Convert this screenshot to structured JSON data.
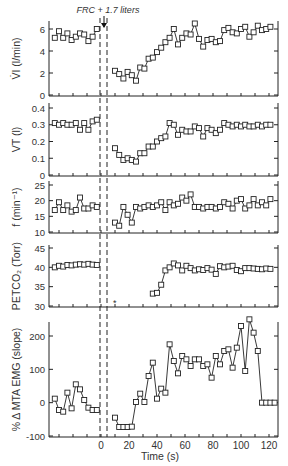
{
  "annotation": "FRC + 1.7 liters",
  "xaxis": {
    "label": "Time (s)",
    "ticks": [
      0,
      20,
      40,
      60,
      80,
      100,
      120
    ],
    "range": [
      -37,
      126
    ]
  },
  "chart_data": [
    {
      "type": "line",
      "ylabel": "V̇I (l/min)",
      "yticks": [
        0,
        2,
        4,
        6
      ],
      "ylim": [
        0,
        7
      ],
      "series": [
        {
          "name": "pre",
          "x": [
            -33,
            -30,
            -27,
            -24,
            -21,
            -18,
            -15,
            -12,
            -9,
            -6,
            -3
          ],
          "values": [
            5.2,
            5.8,
            5.2,
            5.6,
            5.0,
            5.3,
            5.6,
            5.5,
            4.9,
            5.3,
            6.0
          ]
        },
        {
          "name": "post",
          "x": [
            10,
            13,
            16,
            19,
            22,
            25,
            28,
            31,
            34,
            37,
            40,
            43,
            46,
            49,
            52,
            55,
            58,
            61,
            64,
            67,
            70,
            73,
            76,
            79,
            82,
            85,
            88,
            91,
            94,
            97,
            100,
            103,
            106,
            109,
            112,
            115,
            118,
            121
          ],
          "values": [
            2.2,
            1.9,
            1.5,
            2.1,
            1.8,
            1.3,
            2.5,
            2.4,
            3.3,
            3.4,
            3.9,
            4.3,
            4.8,
            5.2,
            6.0,
            4.6,
            5.2,
            5.6,
            5.5,
            6.5,
            5.1,
            4.4,
            5.0,
            5.1,
            4.8,
            4.9,
            5.9,
            6.1,
            5.7,
            5.6,
            6.0,
            6.2,
            5.3,
            5.7,
            6.3,
            5.9,
            6.0,
            6.2
          ]
        }
      ]
    },
    {
      "type": "line",
      "ylabel": "VT (l)",
      "yticks": [
        0,
        0.1,
        0.2,
        0.3,
        0.4
      ],
      "ylim": [
        0,
        0.4
      ],
      "series": [
        {
          "name": "pre",
          "x": [
            -33,
            -30,
            -27,
            -24,
            -21,
            -18,
            -15,
            -12,
            -9,
            -6,
            -3
          ],
          "values": [
            0.31,
            0.3,
            0.31,
            0.3,
            0.3,
            0.31,
            0.27,
            0.31,
            0.27,
            0.32,
            0.33
          ]
        },
        {
          "name": "post",
          "x": [
            10,
            13,
            16,
            19,
            22,
            25,
            28,
            31,
            34,
            37,
            40,
            43,
            46,
            49,
            52,
            55,
            58,
            61,
            64,
            67,
            70,
            73,
            76,
            79,
            82,
            85,
            88,
            91,
            94,
            97,
            100,
            103,
            106,
            109,
            112,
            115,
            118,
            121
          ],
          "values": [
            0.16,
            0.12,
            0.09,
            0.1,
            0.09,
            0.08,
            0.13,
            0.13,
            0.17,
            0.17,
            0.2,
            0.22,
            0.23,
            0.31,
            0.3,
            0.24,
            0.27,
            0.26,
            0.26,
            0.29,
            0.28,
            0.23,
            0.28,
            0.27,
            0.25,
            0.27,
            0.31,
            0.3,
            0.29,
            0.3,
            0.29,
            0.3,
            0.29,
            0.29,
            0.3,
            0.29,
            0.3,
            0.3
          ]
        }
      ]
    },
    {
      "type": "line",
      "ylabel": "f (min⁻¹)",
      "yticks": [
        10,
        15,
        20,
        25
      ],
      "ylim": [
        10,
        25
      ],
      "series": [
        {
          "name": "pre",
          "x": [
            -33,
            -30,
            -27,
            -24,
            -21,
            -18,
            -15,
            -12,
            -9,
            -6,
            -3
          ],
          "values": [
            17,
            19.5,
            17,
            18.5,
            16.5,
            17,
            21,
            17.5,
            17.5,
            18.5,
            18
          ]
        },
        {
          "name": "post",
          "x": [
            10,
            13,
            16,
            19,
            22,
            25,
            28,
            31,
            34,
            37,
            40,
            43,
            46,
            49,
            52,
            55,
            58,
            61,
            64,
            67,
            70,
            73,
            76,
            79,
            82,
            85,
            88,
            91,
            94,
            97,
            100,
            103,
            106,
            109,
            112,
            115,
            118,
            121
          ],
          "values": [
            13,
            12,
            18,
            15.5,
            13,
            18,
            17.5,
            18,
            18.5,
            18,
            18.5,
            19.5,
            17,
            19.5,
            18.5,
            19,
            21,
            20,
            22,
            18,
            18,
            17.5,
            18,
            18,
            17.5,
            18,
            19.5,
            19,
            17.5,
            20,
            20.5,
            17.5,
            18.5,
            20.5,
            18.5,
            19.5,
            18.5,
            20.5
          ]
        }
      ]
    },
    {
      "type": "line",
      "ylabel": "PETCO₂ (Torr)",
      "yticks": [
        30,
        35,
        40,
        45
      ],
      "ylim": [
        30,
        45
      ],
      "series": [
        {
          "name": "pre",
          "x": [
            -33,
            -30,
            -27,
            -24,
            -21,
            -18,
            -15,
            -12,
            -9,
            -6,
            -3
          ],
          "values": [
            40.0,
            40.4,
            40.2,
            40.6,
            40.5,
            40.7,
            40.8,
            40.7,
            40.9,
            40.7,
            40.6
          ]
        },
        {
          "name": "post",
          "x": [
            37,
            40,
            43,
            46,
            49,
            52,
            55,
            58,
            61,
            64,
            67,
            70,
            73,
            76,
            79,
            82,
            85,
            88,
            91,
            94,
            97,
            100,
            103,
            106,
            109,
            112,
            115,
            118,
            121
          ],
          "values": [
            33.2,
            33.4,
            35.5,
            39.2,
            40.0,
            41.0,
            40.5,
            39.2,
            40.4,
            39.8,
            39.2,
            39.5,
            39.3,
            39.8,
            39.4,
            38.3,
            40.3,
            40.0,
            40.2,
            40.4,
            39.3,
            39.0,
            39.8,
            39.8,
            39.7,
            39.6,
            39.5,
            39.7,
            39.6
          ]
        }
      ]
    },
    {
      "type": "line",
      "ylabel": "% Δ MTA EMG (slope)",
      "yticks": [
        -100,
        0,
        100,
        200
      ],
      "ylim": [
        -100,
        250
      ],
      "series": [
        {
          "name": "pre",
          "x": [
            -33,
            -30,
            -27,
            -24,
            -21,
            -18,
            -15,
            -12,
            -9,
            -6,
            -3
          ],
          "values": [
            12,
            -22,
            -27,
            30,
            -17,
            55,
            40,
            8,
            -15,
            -22,
            -22
          ]
        },
        {
          "name": "post",
          "x": [
            10,
            13,
            16,
            19,
            22,
            25,
            28,
            31,
            34,
            37,
            40,
            43,
            46,
            49,
            52,
            55,
            58,
            61,
            64,
            67,
            70,
            73,
            76,
            79,
            82,
            85,
            88,
            91,
            94,
            97,
            100,
            103,
            106,
            109,
            112,
            115,
            118,
            121,
            124
          ],
          "values": [
            -45,
            -73,
            -73,
            -73,
            -72,
            2,
            27,
            2,
            80,
            120,
            12,
            42,
            30,
            175,
            125,
            88,
            140,
            130,
            110,
            130,
            130,
            110,
            115,
            75,
            140,
            115,
            155,
            160,
            105,
            165,
            230,
            95,
            250,
            210,
            155,
            0,
            0,
            0,
            0
          ]
        }
      ],
      "note": "last four post values unused"
    }
  ]
}
